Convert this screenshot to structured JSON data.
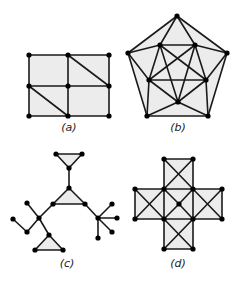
{
  "colors": {
    "face": "#ececec",
    "edge": "#1a1a1a",
    "vertex": "#000000",
    "label": "#222222"
  },
  "graphs": [
    {
      "id": "a",
      "label": "(a)",
      "label_pos": [
        69,
        131
      ],
      "vertices": [
        [
          29,
          55
        ],
        [
          68,
          55
        ],
        [
          109,
          55
        ],
        [
          29,
          86
        ],
        [
          68,
          86
        ],
        [
          109,
          86
        ],
        [
          29,
          116
        ],
        [
          68,
          116
        ],
        [
          109,
          116
        ]
      ],
      "faces": [
        [
          [
            29,
            55
          ],
          [
            109,
            55
          ],
          [
            109,
            116
          ],
          [
            29,
            116
          ]
        ]
      ],
      "edges": [
        [
          0,
          1
        ],
        [
          1,
          2
        ],
        [
          3,
          4
        ],
        [
          4,
          5
        ],
        [
          6,
          7
        ],
        [
          7,
          8
        ],
        [
          0,
          3
        ],
        [
          3,
          6
        ],
        [
          1,
          4
        ],
        [
          4,
          7
        ],
        [
          2,
          5
        ],
        [
          5,
          8
        ],
        [
          1,
          5
        ],
        [
          3,
          7
        ]
      ]
    },
    {
      "id": "b",
      "label": "(b)",
      "label_pos": [
        178,
        131
      ],
      "vertices": [
        [
          177,
          16
        ],
        [
          227,
          53
        ],
        [
          208,
          116
        ],
        [
          147,
          116
        ],
        [
          128,
          53
        ],
        [
          160,
          45
        ],
        [
          195,
          45
        ],
        [
          206,
          80
        ],
        [
          178,
          102
        ],
        [
          149,
          80
        ]
      ],
      "faces": [
        [
          [
            177,
            16
          ],
          [
            227,
            53
          ],
          [
            208,
            116
          ],
          [
            147,
            116
          ],
          [
            128,
            53
          ]
        ]
      ],
      "edges": [
        [
          0,
          1
        ],
        [
          1,
          2
        ],
        [
          2,
          3
        ],
        [
          3,
          4
        ],
        [
          4,
          0
        ],
        [
          5,
          6
        ],
        [
          9,
          7
        ],
        [
          5,
          9
        ],
        [
          6,
          7
        ],
        [
          5,
          7
        ],
        [
          6,
          9
        ],
        [
          5,
          8
        ],
        [
          6,
          8
        ],
        [
          9,
          8
        ],
        [
          7,
          8
        ],
        [
          0,
          5
        ],
        [
          0,
          6
        ],
        [
          4,
          5
        ],
        [
          4,
          9
        ],
        [
          1,
          6
        ],
        [
          1,
          7
        ],
        [
          3,
          9
        ],
        [
          3,
          8
        ],
        [
          2,
          7
        ],
        [
          2,
          8
        ]
      ]
    },
    {
      "id": "c",
      "label": "(c)",
      "label_pos": [
        67,
        267
      ],
      "vertices": [
        [
          56,
          154
        ],
        [
          82,
          154
        ],
        [
          69,
          168
        ],
        [
          69,
          188
        ],
        [
          53,
          204
        ],
        [
          85,
          204
        ],
        [
          39,
          218
        ],
        [
          27,
          203
        ],
        [
          27,
          232
        ],
        [
          13,
          219
        ],
        [
          49,
          235
        ],
        [
          35,
          250
        ],
        [
          63,
          250
        ],
        [
          98,
          218
        ],
        [
          112,
          204
        ],
        [
          117,
          218
        ],
        [
          112,
          232
        ],
        [
          98,
          238
        ]
      ],
      "faces": [
        [
          [
            56,
            154
          ],
          [
            82,
            154
          ],
          [
            69,
            168
          ]
        ],
        [
          [
            69,
            188
          ],
          [
            53,
            204
          ],
          [
            85,
            204
          ]
        ],
        [
          [
            49,
            235
          ],
          [
            35,
            250
          ],
          [
            63,
            250
          ]
        ]
      ],
      "edges": [
        [
          0,
          1
        ],
        [
          1,
          2
        ],
        [
          2,
          0
        ],
        [
          2,
          3
        ],
        [
          3,
          4
        ],
        [
          4,
          5
        ],
        [
          5,
          3
        ],
        [
          4,
          6
        ],
        [
          6,
          7
        ],
        [
          6,
          8
        ],
        [
          8,
          9
        ],
        [
          6,
          10
        ],
        [
          10,
          11
        ],
        [
          11,
          12
        ],
        [
          12,
          10
        ],
        [
          5,
          13
        ],
        [
          13,
          14
        ],
        [
          13,
          15
        ],
        [
          13,
          16
        ],
        [
          13,
          17
        ]
      ]
    },
    {
      "id": "d",
      "label": "(d)",
      "label_pos": [
        178,
        267
      ],
      "vertices": [
        [
          164,
          159
        ],
        [
          193,
          159
        ],
        [
          135,
          189
        ],
        [
          164,
          189
        ],
        [
          193,
          189
        ],
        [
          222,
          189
        ],
        [
          135,
          219
        ],
        [
          164,
          219
        ],
        [
          193,
          219
        ],
        [
          222,
          219
        ],
        [
          164,
          249
        ],
        [
          193,
          249
        ],
        [
          179,
          204
        ]
      ],
      "faces": [
        [
          [
            164,
            159
          ],
          [
            193,
            159
          ],
          [
            193,
            189
          ],
          [
            222,
            189
          ],
          [
            222,
            219
          ],
          [
            193,
            219
          ],
          [
            193,
            249
          ],
          [
            164,
            249
          ],
          [
            164,
            219
          ],
          [
            135,
            219
          ],
          [
            135,
            189
          ],
          [
            164,
            189
          ]
        ]
      ],
      "edges": [
        [
          0,
          1
        ],
        [
          0,
          3
        ],
        [
          1,
          4
        ],
        [
          0,
          4
        ],
        [
          1,
          3
        ],
        [
          2,
          3
        ],
        [
          3,
          4
        ],
        [
          4,
          5
        ],
        [
          2,
          6
        ],
        [
          5,
          9
        ],
        [
          6,
          7
        ],
        [
          7,
          8
        ],
        [
          8,
          9
        ],
        [
          2,
          7
        ],
        [
          3,
          6
        ],
        [
          4,
          9
        ],
        [
          5,
          8
        ],
        [
          3,
          7
        ],
        [
          4,
          8
        ],
        [
          3,
          12
        ],
        [
          4,
          12
        ],
        [
          7,
          12
        ],
        [
          8,
          12
        ],
        [
          7,
          10
        ],
        [
          8,
          11
        ],
        [
          10,
          11
        ],
        [
          7,
          11
        ],
        [
          8,
          10
        ]
      ]
    }
  ]
}
